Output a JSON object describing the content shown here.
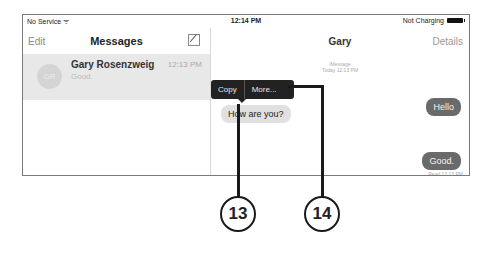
{
  "status_bar": {
    "carrier": "No Service ᯤ",
    "time": "12:14 PM",
    "battery_text": "Not Charging"
  },
  "sidebar": {
    "edit_label": "Edit",
    "title": "Messages",
    "conversations": [
      {
        "initials": "GR",
        "name": "Gary Rosenzweig",
        "time": "12:13 PM",
        "preview": "Good."
      }
    ]
  },
  "chat": {
    "title": "Gary",
    "details_label": "Details",
    "service_label": "iMessage",
    "timestamp_label": "Today 12:13 PM",
    "context_menu": {
      "copy_label": "Copy",
      "more_label": "More..."
    },
    "messages": [
      {
        "direction": "incoming",
        "text": "How are you?"
      },
      {
        "direction": "outgoing",
        "text": "Hello"
      },
      {
        "direction": "outgoing",
        "text": "Good."
      }
    ],
    "read_receipt": "Read 12:13 PM"
  },
  "callouts": [
    {
      "number": "13"
    },
    {
      "number": "14"
    }
  ],
  "colors": {
    "outgoing_bubble": "#6a6a6a",
    "incoming_bubble": "#e0e0e0",
    "context_menu": "#222222",
    "selected_row": "#e8e8e8"
  }
}
